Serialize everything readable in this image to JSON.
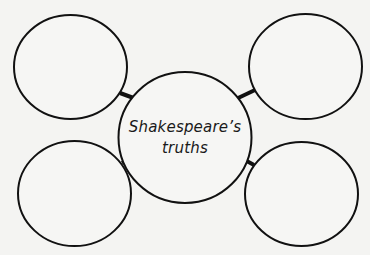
{
  "diagram": {
    "type": "concept-web",
    "center": {
      "line1": "Shakespeare’s",
      "line2": "truths"
    },
    "nodes": [
      {
        "position": "top-left",
        "text": ""
      },
      {
        "position": "top-right",
        "text": ""
      },
      {
        "position": "bottom-left",
        "text": ""
      },
      {
        "position": "bottom-right",
        "text": ""
      }
    ],
    "colors": {
      "stroke": "#111111",
      "background": "#f4f4f2",
      "node_fill": "#f6f6f4"
    }
  }
}
